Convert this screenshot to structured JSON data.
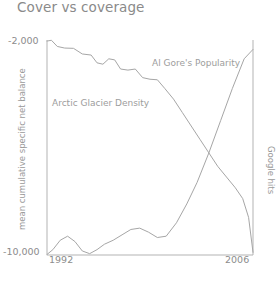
{
  "chart_data": {
    "type": "line",
    "title": "Cover vs coverage",
    "xlabel": "",
    "ylabel": "mean cumulative specific net balance",
    "ylabel_right": "Google hits",
    "grid": false,
    "legend": "annotations-inline",
    "xlim": [
      1992,
      2006
    ],
    "xticks": [
      "1992",
      "2006"
    ],
    "ylim": [
      -10000,
      -2000
    ],
    "yticks": [
      "-2,000",
      "-10,000"
    ],
    "axis_color": "#b3b3b3",
    "line_color": "#a6a6a6",
    "text_color": "#8c8c8c",
    "series": [
      {
        "name": "Arctic Glacier Density",
        "axis": "left",
        "annotation": "Arctic Glacier Density",
        "x": [
          1992.0,
          1992.3,
          1992.7,
          1993.2,
          1993.8,
          1994.4,
          1995.0,
          1995.4,
          1995.8,
          1996.2,
          1996.6,
          1997.0,
          1997.5,
          1998.0,
          1998.5,
          1999.0,
          1999.5,
          2000.0,
          2000.6,
          2001.2,
          2001.8,
          2002.4,
          2003.0,
          2003.6,
          2004.2,
          2004.8,
          2005.3,
          2005.7,
          2006.0
        ],
        "values": [
          -2040,
          -2010,
          -2240,
          -2300,
          -2310,
          -2520,
          -2560,
          -2850,
          -2900,
          -2700,
          -2740,
          -3080,
          -3120,
          -3080,
          -3400,
          -3460,
          -3480,
          -3800,
          -4200,
          -4700,
          -5200,
          -5700,
          -6200,
          -6700,
          -7100,
          -7500,
          -7900,
          -8600,
          -9900
        ]
      },
      {
        "name": "Al Gore's Popularity",
        "axis": "right",
        "annotation": "Al Gore's Popularity",
        "x": [
          1992.0,
          1992.4,
          1992.9,
          1993.4,
          1993.9,
          1994.4,
          1994.9,
          1995.4,
          1995.9,
          1996.5,
          1997.1,
          1997.7,
          1998.3,
          1998.9,
          1999.5,
          2000.1,
          2000.8,
          2001.5,
          2002.2,
          2003.0,
          2003.8,
          2004.6,
          2005.4,
          2006.0
        ],
        "values": [
          -9980,
          -9800,
          -9450,
          -9300,
          -9500,
          -9850,
          -9950,
          -9800,
          -9600,
          -9450,
          -9250,
          -9050,
          -9000,
          -9150,
          -9350,
          -9300,
          -8800,
          -8100,
          -7300,
          -6200,
          -5000,
          -3800,
          -2700,
          -2350
        ]
      }
    ]
  }
}
